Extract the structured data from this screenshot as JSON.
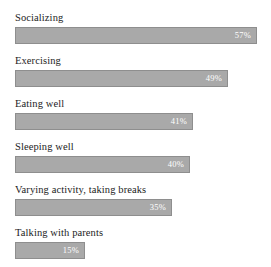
{
  "chart_data": {
    "type": "bar",
    "orientation": "horizontal",
    "title": "",
    "subtitle": "",
    "xlabel": "",
    "ylabel": "",
    "grid": false,
    "legend": null,
    "value_suffix": "%",
    "axis_max_percent": 57,
    "bar_pixel_max": 242,
    "categories": [
      "Socializing",
      "Exercising",
      "Eating well",
      "Sleeping well",
      "Varying activity, taking breaks",
      "Talking with parents"
    ],
    "values": [
      57,
      49,
      41,
      40,
      35,
      15
    ],
    "value_labels": [
      "57%",
      "49%",
      "41%",
      "40%",
      "35%",
      "15%"
    ],
    "bar_widths_px": [
      242,
      213,
      178,
      175,
      157,
      70
    ],
    "bars": [
      {
        "label": "Socializing",
        "value": 57,
        "value_label": "57%",
        "width_px": 242
      },
      {
        "label": "Exercising",
        "value": 49,
        "value_label": "49%",
        "width_px": 213
      },
      {
        "label": "Eating well",
        "value": 41,
        "value_label": "41%",
        "width_px": 178
      },
      {
        "label": "Sleeping well",
        "value": 40,
        "value_label": "40%",
        "width_px": 175
      },
      {
        "label": "Varying activity, taking breaks",
        "value": 35,
        "value_label": "35%",
        "width_px": 157
      },
      {
        "label": "Talking with parents",
        "value": 15,
        "value_label": "15%",
        "width_px": 70
      }
    ]
  },
  "colors": {
    "bar_fill": "#a9a9a9",
    "bar_border": "#8e8e8e",
    "value_text": "#ffffff",
    "label_text": "#1c1c1c",
    "background": "#ffffff"
  }
}
